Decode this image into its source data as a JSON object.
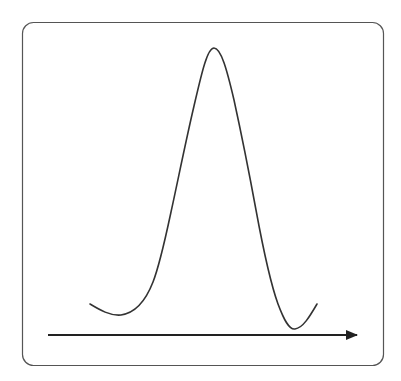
{
  "diagram": {
    "type": "single-peak-curve",
    "frame": {
      "x": 22,
      "y": 22,
      "width": 362,
      "height": 344,
      "radius": 11,
      "stroke": "#555555"
    },
    "curve": {
      "stroke": "#333333",
      "stroke_width": 1.6,
      "points": [
        [
          90,
          304
        ],
        [
          121,
          315
        ],
        [
          150,
          290
        ],
        [
          164,
          250
        ],
        [
          186,
          150
        ],
        [
          214,
          48
        ],
        [
          244,
          150
        ],
        [
          264,
          250
        ],
        [
          280,
          310
        ],
        [
          295,
          329
        ],
        [
          317,
          304
        ]
      ],
      "peak": [
        214,
        48
      ]
    },
    "axis": {
      "x1": 48,
      "y1": 335,
      "x2": 357,
      "y2": 335,
      "stroke": "#222222",
      "arrowhead": "right"
    }
  }
}
